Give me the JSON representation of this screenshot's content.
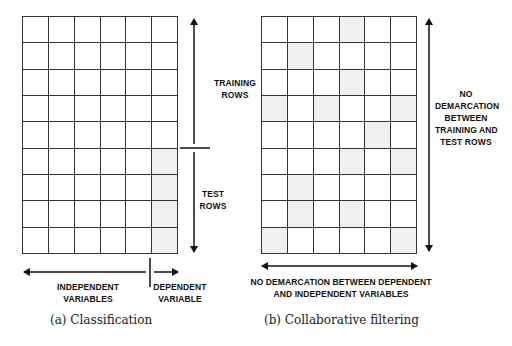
{
  "panel_a": {
    "caption": "(a) Classification",
    "rows": 9,
    "cols": 6,
    "shaded": [
      [
        5,
        5
      ],
      [
        6,
        5
      ],
      [
        7,
        5
      ],
      [
        8,
        5
      ]
    ],
    "label_training": [
      "TRAINING",
      "ROWS"
    ],
    "label_test": [
      "TEST",
      "ROWS"
    ],
    "label_independent": [
      "INDEPENDENT",
      "VARIABLES"
    ],
    "label_dependent": [
      "DEPENDENT",
      "VARIABLE"
    ]
  },
  "panel_b": {
    "caption": "(b) Collaborative filtering",
    "rows": 9,
    "cols": 6,
    "shaded": [
      [
        0,
        3
      ],
      [
        1,
        1
      ],
      [
        2,
        3
      ],
      [
        3,
        0
      ],
      [
        3,
        2
      ],
      [
        3,
        5
      ],
      [
        4,
        4
      ],
      [
        5,
        3
      ],
      [
        5,
        5
      ],
      [
        6,
        1
      ],
      [
        7,
        1
      ],
      [
        7,
        3
      ],
      [
        8,
        0
      ],
      [
        8,
        5
      ]
    ],
    "label_rows": [
      "NO",
      "DEMARCATION",
      "BETWEEN",
      "TRAINING AND",
      "TEST ROWS"
    ],
    "label_cols": [
      "NO DEMARCATION BETWEEN DEPENDENT",
      "AND INDEPENDENT VARIABLES"
    ]
  },
  "colors": {
    "line": "#333333",
    "shade": "#f0f0f0",
    "arrow": "#111111"
  }
}
